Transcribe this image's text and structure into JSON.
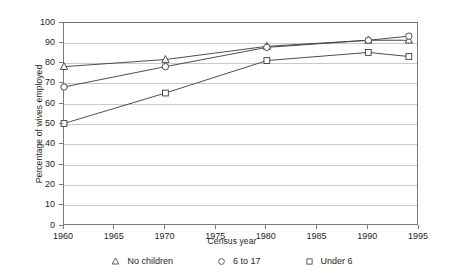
{
  "chart_data": {
    "type": "line",
    "title": "",
    "xlabel": "Census year",
    "ylabel": "Percentage of wives employed",
    "xlim": [
      1960,
      1995
    ],
    "ylim": [
      0,
      100
    ],
    "xticks": [
      1960,
      1965,
      1970,
      1975,
      1980,
      1985,
      1990,
      1995
    ],
    "xtick_labels": [
      "1960",
      "1965",
      "1970",
      "1975",
      "1980",
      "1985",
      "1990",
      "1995"
    ],
    "yticks": [
      0,
      10,
      20,
      30,
      40,
      50,
      60,
      70,
      80,
      90,
      100
    ],
    "ytick_labels": [
      "0",
      "10",
      "20",
      "30",
      "40",
      "50",
      "60",
      "70",
      "80",
      "90",
      "100"
    ],
    "grid": "horizontal",
    "legend_position": "bottom",
    "x": [
      1960,
      1970,
      1980,
      1990,
      1994
    ],
    "series": [
      {
        "name": "No children",
        "marker": "triangle",
        "color": "#3a3a3a",
        "values": [
          78.5,
          82.0,
          88.5,
          91.5,
          91.5
        ]
      },
      {
        "name": "6 to 17",
        "marker": "circle",
        "color": "#3a3a3a",
        "values": [
          68.5,
          78.5,
          88.0,
          91.5,
          93.5
        ]
      },
      {
        "name": "Under 6",
        "marker": "square",
        "color": "#3a3a3a",
        "values": [
          50.5,
          65.5,
          81.5,
          85.5,
          83.5
        ]
      }
    ]
  },
  "legend": {
    "items": [
      {
        "label": "No children",
        "marker": "triangle-marker"
      },
      {
        "label": "6 to 17",
        "marker": "circle-marker"
      },
      {
        "label": "Under 6",
        "marker": "square-marker"
      }
    ]
  },
  "axes": {
    "x_title": "Census year",
    "y_title": "Percentage of wives employed"
  },
  "colors": {
    "line": "#3a3a3a",
    "grid": "#c9c9c9",
    "axis": "#7a7a7a",
    "text": "#231f20",
    "background": "#ffffff"
  }
}
